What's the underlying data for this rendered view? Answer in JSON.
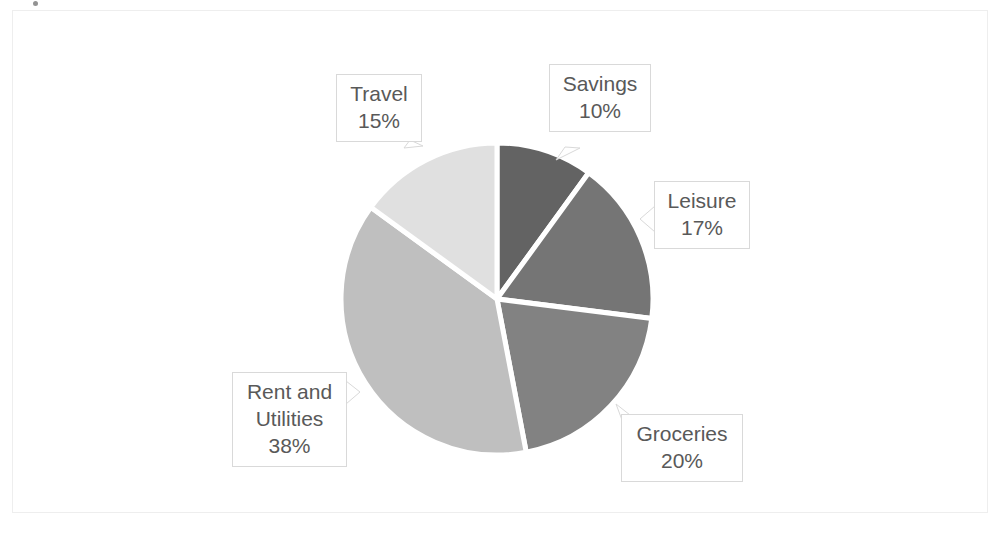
{
  "chart_data": {
    "type": "pie",
    "title": "",
    "subtitle": "",
    "xlabel": "",
    "ylabel": "",
    "legend": "none",
    "grid": false,
    "label_format": "category-name-and-percent",
    "categories": [
      "Savings",
      "Leisure",
      "Groceries",
      "Rent and Utilities",
      "Travel"
    ],
    "values": [
      10,
      17,
      20,
      38,
      15
    ],
    "value_labels": [
      "10%",
      "17%",
      "20%",
      "38%",
      "15%"
    ],
    "unit": "%",
    "total": 100,
    "start_angle_deg": 0,
    "direction": "clockwise",
    "slices": [
      {
        "name": "Savings",
        "value": 10,
        "label": "10%",
        "color": "#636363",
        "start_deg": 0,
        "end_deg": 36
      },
      {
        "name": "Leisure",
        "value": 17,
        "label": "17%",
        "color": "#757575",
        "start_deg": 36,
        "end_deg": 97.2
      },
      {
        "name": "Groceries",
        "value": 20,
        "label": "20%",
        "color": "#828282",
        "start_deg": 97.2,
        "end_deg": 169.2
      },
      {
        "name": "Rent and Utilities",
        "value": 38,
        "label": "38%",
        "color": "#bfbfbf",
        "start_deg": 169.2,
        "end_deg": 306
      },
      {
        "name": "Travel",
        "value": 15,
        "label": "15%",
        "color": "#e0e0e0",
        "start_deg": 306,
        "end_deg": 360
      }
    ]
  },
  "labels": {
    "savings": {
      "name": "Savings",
      "value": "10%"
    },
    "leisure": {
      "name": "Leisure",
      "value": "17%"
    },
    "groceries": {
      "name": "Groceries",
      "value": "20%"
    },
    "rent": {
      "name": "Rent and",
      "name2": "Utilities",
      "value": "38%"
    },
    "travel": {
      "name": "Travel",
      "value": "15%"
    }
  },
  "colors": {
    "savings": "#636363",
    "leisure": "#757575",
    "groceries": "#828282",
    "rent": "#bfbfbf",
    "travel": "#e0e0e0",
    "separator": "#ffffff",
    "label_border": "#d9d9d9",
    "label_text": "#595959",
    "chart_border": "#eeeeee",
    "background": "#ffffff"
  },
  "geometry": {
    "center_x": 497,
    "center_y": 299,
    "radius": 156
  }
}
